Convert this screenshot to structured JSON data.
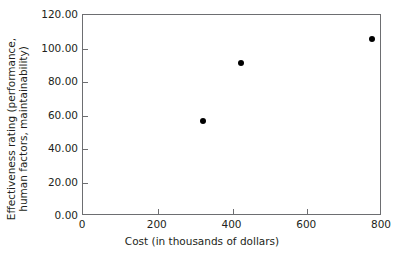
{
  "chart_data": {
    "type": "scatter",
    "title": "",
    "xlabel": "Cost (in thousands of dollars)",
    "ylabel_line1": "Effectiveness rating (performance,",
    "ylabel_line2": "human factors, maintainability)",
    "xlim": [
      0,
      800
    ],
    "ylim": [
      0,
      120
    ],
    "xticks": [
      "0",
      "200",
      "400",
      "600",
      "800"
    ],
    "xtick_values": [
      0,
      200,
      400,
      600,
      800
    ],
    "yticks": [
      "0.00",
      "20.00",
      "40.00",
      "60.00",
      "80.00",
      "100.00",
      "120.00"
    ],
    "ytick_values": [
      0,
      20,
      40,
      60,
      80,
      100,
      120
    ],
    "grid": false,
    "legend": null,
    "marker_color": "#000000",
    "axis_color": "#6d6e71",
    "text_color": "#231f20",
    "points": [
      {
        "x": 322,
        "y": 56.7
      },
      {
        "x": 424,
        "y": 91.3
      },
      {
        "x": 773,
        "y": 105.7
      }
    ]
  }
}
